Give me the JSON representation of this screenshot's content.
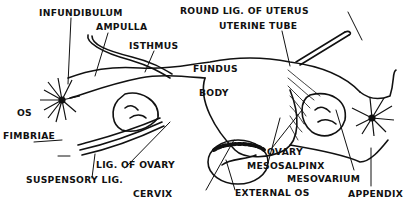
{
  "figure": {
    "style": "black ink line illustration",
    "colors": {
      "ink": "#111111",
      "background": "#ffffff"
    }
  },
  "labels": {
    "infundibulum": "INFUNDIBULUM",
    "ampulla": "AMPULLA",
    "isthmus": "ISTHMUS",
    "round_lig": "ROUND LIG. OF UTERUS",
    "uterine_tube": "UTERINE TUBE",
    "fundus": "FUNDUS",
    "body": "BODY",
    "os": "OS",
    "fimbriae": "FIMBRIAE",
    "lig_of_ovary": "LIG. OF OVARY",
    "suspensory_lig": "SUSPENSORY LIG.",
    "cervix": "CERVIX",
    "external_os": "EXTERNAL OS",
    "ovary": "OVARY",
    "mesosalpinx": "MESOSALPINX",
    "mesovarium": "MESOVARIUM",
    "appendix": "APPENDIX"
  }
}
